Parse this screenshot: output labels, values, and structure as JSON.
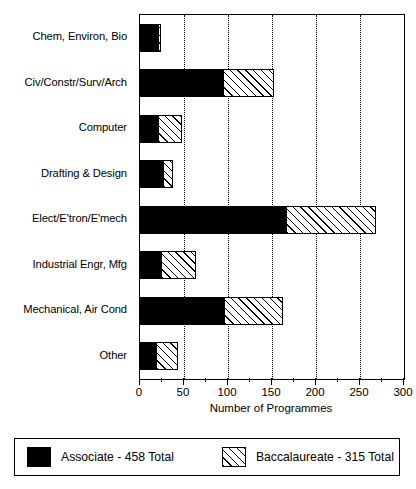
{
  "chart_data": {
    "type": "bar",
    "orientation": "horizontal",
    "stacked": true,
    "title": "",
    "xlabel": "Number of Programmes",
    "ylabel": "",
    "xlim": [
      0,
      300
    ],
    "xticks": [
      0,
      50,
      100,
      150,
      200,
      250,
      300
    ],
    "xtick_labels": [
      "0",
      "50",
      "100",
      "150",
      "200",
      "250",
      "300"
    ],
    "minor_tick_interval": 25,
    "grid": "vertical dotted at 50,100,150,200,250",
    "legend_position": "below plot, bordered box",
    "categories": [
      "Chem, Environ, Bio",
      "Civ/Constr/Surv/Arch",
      "Computer",
      "Drafting & Design",
      "Elect/E'tron/E'mech",
      "Industrial Engr, Mfg",
      "Mechanical, Air Cond",
      "Other"
    ],
    "series": [
      {
        "name": "Associate",
        "legend_label": "Associate - 458 Total",
        "total": 458,
        "color": "#000000",
        "fill": "solid-black",
        "values": [
          22,
          95,
          22,
          27,
          167,
          25,
          97,
          19
        ]
      },
      {
        "name": "Baccalaureate",
        "legend_label": "Baccalaureate - 315 Total",
        "total": 315,
        "color": "#ffffff",
        "fill": "diagonal-hatch",
        "values": [
          2,
          57,
          26,
          10,
          101,
          39,
          65,
          24
        ]
      }
    ]
  },
  "axis": {
    "x_title": "Number of Programmes",
    "tick_labels": [
      "0",
      "50",
      "100",
      "150",
      "200",
      "250",
      "300"
    ]
  },
  "categories": [
    {
      "label": "Chem, Environ, Bio"
    },
    {
      "label": "Civ/Constr/Surv/Arch"
    },
    {
      "label": "Computer"
    },
    {
      "label": "Drafting & Design"
    },
    {
      "label": "Elect/E'tron/E'mech"
    },
    {
      "label": "Industrial Engr, Mfg"
    },
    {
      "label": "Mechanical, Air Cond"
    },
    {
      "label": "Other"
    }
  ],
  "legend": {
    "items": [
      {
        "label": "Associate - 458 Total",
        "swatch": "solid-black"
      },
      {
        "label": "Baccalaureate - 315 Total",
        "swatch": "diagonal-hatch"
      }
    ]
  }
}
